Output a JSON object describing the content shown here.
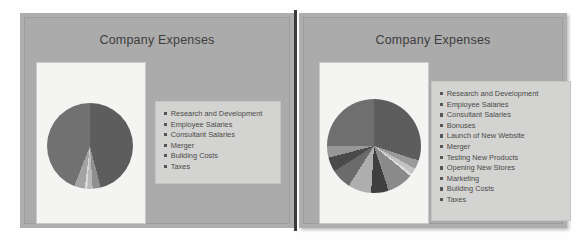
{
  "slides": [
    {
      "id": "left",
      "title": "Company Expenses",
      "chart_data": {
        "type": "pie",
        "title": "Company Expenses",
        "legend_position": "right",
        "categories": [
          "Research and Development",
          "Employee Salaries",
          "Consultant Salaries",
          "Merger",
          "Building Costs",
          "Taxes"
        ],
        "values": [
          46,
          3,
          2,
          1,
          4,
          44
        ],
        "colors": [
          "#5d5d5d",
          "#8f8f8f",
          "#b9b9b9",
          "#d8d8d8",
          "#a3a3a3",
          "#717171"
        ],
        "xlabel": "",
        "ylabel": ""
      }
    },
    {
      "id": "right",
      "title": "Company Expenses",
      "chart_data": {
        "type": "pie",
        "title": "Company Expenses",
        "legend_position": "right",
        "categories": [
          "Research and Development",
          "Employee Salaries",
          "Consultant Salaries",
          "Bonuses",
          "Launch of New Website",
          "Merger",
          "Testing New Products",
          "Opening New Stores",
          "Marketing",
          "Building Costs",
          "Taxes"
        ],
        "values": [
          30,
          3,
          2,
          1,
          9,
          6,
          8,
          7,
          5,
          4,
          25
        ],
        "colors": [
          "#5d5d5d",
          "#9a9a9a",
          "#c2c2c2",
          "#dcdcdc",
          "#8a8a8a",
          "#3f3f3f",
          "#aeaeae",
          "#6b6b6b",
          "#4a4a4a",
          "#979797",
          "#6f6f6f"
        ],
        "xlabel": "",
        "ylabel": ""
      }
    }
  ],
  "legend_marker": "square-marker-icon",
  "colors": {
    "slide_background": "#ababab",
    "plot_background": "#f4f4f2",
    "legend_background": "#d3d3d1",
    "text": "#4a4a4a",
    "title_text": "#3d3d3d",
    "divider": "#3a3a3a"
  }
}
